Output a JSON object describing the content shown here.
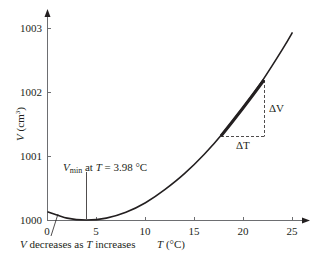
{
  "chart_data": {
    "type": "line",
    "title": "",
    "xlabel": "T (°C)",
    "ylabel": "V (cm³)",
    "xlim": [
      0,
      25
    ],
    "ylim": [
      1000,
      1003
    ],
    "x_ticks": [
      "0",
      "5",
      "10",
      "15",
      "20",
      "25"
    ],
    "y_ticks": [
      "1000",
      "1001",
      "1002",
      "1003"
    ],
    "grid": false,
    "legend": null,
    "series": [
      {
        "name": "Volume of water",
        "x": [
          0,
          2,
          3.98,
          6,
          8,
          10,
          12,
          14,
          16,
          18,
          20,
          22,
          24,
          25
        ],
        "y": [
          1000.13,
          1000.03,
          1000.0,
          1000.03,
          1000.12,
          1000.27,
          1000.48,
          1000.73,
          1001.03,
          1001.38,
          1001.77,
          1002.2,
          1002.68,
          1002.94
        ]
      }
    ],
    "annotations": [
      {
        "text_main": "V",
        "text_sub": "min",
        "text_rest": " at ",
        "text_T": "T",
        "text_value": " = 3.98 °C",
        "x": 3.98,
        "y": 1000.0
      },
      {
        "text_V": "V",
        "text_mid": " decreases as ",
        "text_T": "T",
        "text_end": " increases",
        "x": 1.0,
        "y": 1000.07
      },
      {
        "text": "ΔV",
        "type": "slope-triangle-vertical"
      },
      {
        "text": "ΔT",
        "type": "slope-triangle-horizontal"
      }
    ],
    "tangent_segment": {
      "x": [
        17.6,
        22.0
      ],
      "y": [
        1001.29,
        1002.17
      ]
    }
  },
  "labels": {
    "y_axis_V": "V",
    "y_axis_unit": " (cm",
    "y_axis_sup": "3",
    "y_axis_close": ")",
    "x_axis_T": "T",
    "x_axis_unit": " (°C)",
    "vmin_V": "V",
    "vmin_sub": "min",
    "vmin_at": " at ",
    "vmin_T": "T",
    "vmin_value": " = 3.98 °C",
    "dec_V": "V",
    "dec_mid": " decreases as ",
    "dec_T": "T",
    "dec_end": " increases",
    "delta_V": "ΔV",
    "delta_T": "ΔT"
  },
  "colors": {
    "axis": "#6d6e71",
    "curve": "#231f20",
    "text": "#231f20"
  }
}
